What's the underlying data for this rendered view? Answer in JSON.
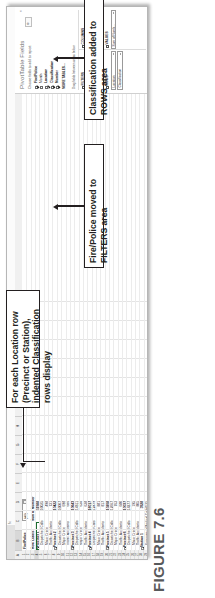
{
  "figure": {
    "caption": "FIGURE 7.6"
  },
  "excel": {
    "name_box": "",
    "formula_label": "fx",
    "columns": [
      "A",
      "B",
      "C",
      "D",
      "E",
      "F",
      "G",
      "H",
      "I",
      "J",
      "K",
      "L",
      "M",
      "N"
    ],
    "selected_column": "B",
    "rows": [
      "1",
      "2",
      "3",
      "4",
      "5",
      "6",
      "7",
      "8",
      "9",
      "10",
      "11",
      "12",
      "13",
      "14",
      "15",
      "16",
      "17",
      "18",
      "19",
      "20",
      "21",
      "22",
      "23",
      "24",
      "25",
      "26",
      "27",
      "28",
      "29"
    ],
    "selected_row": "4",
    "filter": {
      "label": "Fire/Police",
      "value": "(All)"
    },
    "headers": {
      "row_labels": "Row Labels",
      "values": "Sum of Number"
    },
    "pivot_rows": [
      {
        "label": "Precinct 1",
        "value": "11988",
        "bold": true,
        "indent": false
      },
      {
        "label": "Dispatched Calls",
        "value": "10025",
        "bold": false,
        "indent": true
      },
      {
        "label": "Major Crime",
        "value": "498",
        "bold": false,
        "indent": true
      },
      {
        "label": "Traffic Accidents",
        "value": "731",
        "bold": false,
        "indent": true
      },
      {
        "label": "Precinct 2",
        "value": "10422",
        "bold": true,
        "indent": false
      },
      {
        "label": "Dispatched Calls",
        "value": "10007",
        "bold": false,
        "indent": true
      },
      {
        "label": "Major Crime",
        "value": "698",
        "bold": false,
        "indent": true
      },
      {
        "label": "Traffic Accidents",
        "value": "686",
        "bold": false,
        "indent": true
      },
      {
        "label": "Precinct 3",
        "value": "10643",
        "bold": true,
        "indent": false
      },
      {
        "label": "Dispatched Calls",
        "value": "14611",
        "bold": false,
        "indent": true
      },
      {
        "label": "Major Crime",
        "value": "634",
        "bold": false,
        "indent": true
      },
      {
        "label": "Traffic Accidents",
        "value": "638",
        "bold": false,
        "indent": true
      },
      {
        "label": "Precinct 4",
        "value": "16017",
        "bold": true,
        "indent": false
      },
      {
        "label": "Dispatched Calls",
        "value": "12479",
        "bold": false,
        "indent": true
      },
      {
        "label": "Major Crime",
        "value": "881",
        "bold": false,
        "indent": true
      },
      {
        "label": "Traffic Accidents",
        "value": "817",
        "bold": false,
        "indent": true
      },
      {
        "label": "Precinct 5",
        "value": "10208",
        "bold": true,
        "indent": false
      },
      {
        "label": "Dispatched Calls",
        "value": "12667",
        "bold": false,
        "indent": true
      },
      {
        "label": "Major Crime",
        "value": "763",
        "bold": false,
        "indent": true
      },
      {
        "label": "Traffic Accidents",
        "value": "680",
        "bold": false,
        "indent": true
      },
      {
        "label": "Precinct 6",
        "value": "10037",
        "bold": true,
        "indent": false
      },
      {
        "label": "Dispatched Calls",
        "value": "14277",
        "bold": false,
        "indent": true
      },
      {
        "label": "Major Crime",
        "value": "195",
        "bold": false,
        "indent": true
      },
      {
        "label": "Traffic Accidents",
        "value": "805",
        "bold": false,
        "indent": true
      },
      {
        "label": "Station 1",
        "value": "3928",
        "bold": true,
        "indent": false
      },
      {
        "label": "Emergency Medical Calls",
        "value": "2535",
        "bold": false,
        "indent": true
      }
    ]
  },
  "pane": {
    "title": "PivotTable Fields",
    "close_label": "×",
    "gear_label": "⚙",
    "subtitle": "Choose fields to add to report:",
    "fields": [
      {
        "name": "Fire/Police",
        "checked": true,
        "bold": true
      },
      {
        "name": "Month",
        "checked": false,
        "bold": false
      },
      {
        "name": "Location",
        "checked": true,
        "bold": true
      },
      {
        "name": "Classification",
        "checked": true,
        "bold": true
      },
      {
        "name": "Number",
        "checked": true,
        "bold": true
      }
    ],
    "more_tables": "MORE TABLES...",
    "drag_hint": "Drag fields between areas below:",
    "areas": [
      {
        "key": "filters",
        "label": "FILTERS",
        "icon": "filter-icon",
        "chips": [
          "Fire/Police"
        ]
      },
      {
        "key": "columns",
        "label": "COLUMNS",
        "icon": "columns-icon",
        "chips": []
      },
      {
        "key": "rows",
        "label": "ROWS",
        "icon": "rows-icon",
        "chips": [
          "Location",
          "Classification"
        ]
      },
      {
        "key": "values",
        "label": "VALUES",
        "icon": "sigma-icon",
        "chips": [
          "Sum of Numb..."
        ]
      }
    ]
  },
  "annotations": [
    {
      "id": "location-note",
      "text": "For each Location row (Precinct or Station), indented Classification rows display"
    },
    {
      "id": "filters-note",
      "text": "Fire/Police moved to FILTERS area"
    },
    {
      "id": "rows-note",
      "text": "Classification added to ROWS area"
    }
  ]
}
